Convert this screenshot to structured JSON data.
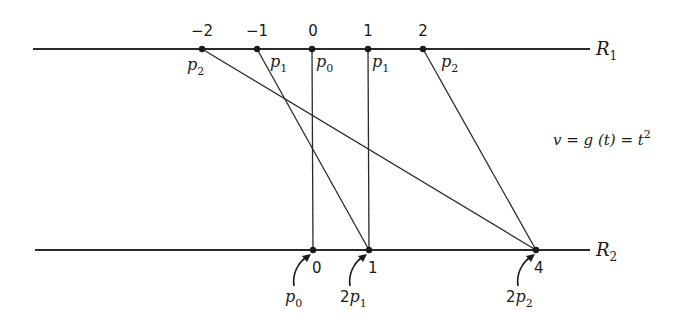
{
  "diagram": {
    "type": "mapping-between-lines",
    "formula": {
      "lhs": "v",
      "mid": "g (t)",
      "rhs_base": "t",
      "rhs_exp": "2",
      "text": "v = g (t) = t²"
    },
    "line_r1": {
      "label": "R",
      "label_sub": "1",
      "y": 49,
      "x_start": 33,
      "x_end": 590
    },
    "line_r2": {
      "label": "R",
      "label_sub": "2",
      "y": 250,
      "x_start": 35,
      "x_end": 590
    },
    "r1_points": [
      {
        "value": "−2",
        "x": 202,
        "point_label": "p",
        "point_sub": "2",
        "label_side": "below-left"
      },
      {
        "value": "−1",
        "x": 257,
        "point_label": "p",
        "point_sub": "1",
        "label_side": "below-right"
      },
      {
        "value": "0",
        "x": 312,
        "point_label": "p",
        "point_sub": "0",
        "label_side": "below-right"
      },
      {
        "value": "1",
        "x": 368,
        "point_label": "p",
        "point_sub": "1",
        "label_side": "below-right"
      },
      {
        "value": "2",
        "x": 423,
        "point_label": "p",
        "point_sub": "2",
        "label_side": "below-right"
      }
    ],
    "r2_points": [
      {
        "value": "0",
        "x": 313,
        "annotation_coef": "",
        "annotation_label": "p",
        "annotation_sub": "0"
      },
      {
        "value": "1",
        "x": 369,
        "annotation_coef": "2",
        "annotation_label": "p",
        "annotation_sub": "1"
      },
      {
        "value": "4",
        "x": 536,
        "annotation_coef": "2",
        "annotation_label": "p",
        "annotation_sub": "2"
      }
    ],
    "mappings": [
      {
        "from": "−2",
        "to": "4"
      },
      {
        "from": "−1",
        "to": "1"
      },
      {
        "from": "0",
        "to": "0"
      },
      {
        "from": "1",
        "to": "1"
      },
      {
        "from": "2",
        "to": "4"
      }
    ]
  }
}
